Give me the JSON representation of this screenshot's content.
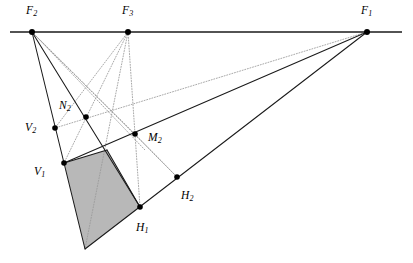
{
  "figure": {
    "canvas": {
      "width": 413,
      "height": 263,
      "background": "#ffffff"
    },
    "colors": {
      "stroke_solid": "#1a1a1a",
      "stroke_dotted": "#9a9a9a",
      "horizon": "#1a1a1a",
      "shaded_fill": "#b8b8b8",
      "point_fill": "#000000",
      "label_color": "#000000"
    },
    "horizon_line": {
      "name": "horizon-line",
      "x1": 10,
      "y1": 32,
      "x2": 402,
      "y2": 32,
      "style": "solid",
      "width": 1.6
    },
    "points": [
      {
        "id": "F2",
        "label": "F",
        "sub": "2",
        "x": 32,
        "y": 32,
        "label_x": 26,
        "label_y": 5,
        "radius": 3.0
      },
      {
        "id": "F3",
        "label": "F",
        "sub": "3",
        "x": 128,
        "y": 32,
        "label_x": 122,
        "label_y": 5,
        "radius": 3.0
      },
      {
        "id": "F1",
        "label": "F",
        "sub": "1",
        "x": 367,
        "y": 32,
        "label_x": 361,
        "label_y": 5,
        "radius": 3.0
      },
      {
        "id": "N2",
        "label": "N",
        "sub": "2",
        "x": 86,
        "y": 117,
        "label_x": 59,
        "label_y": 100,
        "radius": 2.8
      },
      {
        "id": "V2",
        "label": "V",
        "sub": "2",
        "x": 55,
        "y": 128,
        "label_x": 25,
        "label_y": 122,
        "radius": 2.8
      },
      {
        "id": "M2",
        "label": "M",
        "sub": "2",
        "x": 135,
        "y": 134,
        "label_x": 148,
        "label_y": 132,
        "radius": 2.8
      },
      {
        "id": "V1",
        "label": "V",
        "sub": "1",
        "x": 64,
        "y": 163,
        "label_x": 34,
        "label_y": 166,
        "radius": 2.8
      },
      {
        "id": "H2",
        "label": "H",
        "sub": "2",
        "x": 177,
        "y": 177,
        "label_x": 181,
        "label_y": 190,
        "radius": 2.8
      },
      {
        "id": "H1",
        "label": "H",
        "sub": "1",
        "x": 140,
        "y": 207,
        "label_x": 136,
        "label_y": 222,
        "radius": 2.8
      }
    ],
    "shaded_polygon": {
      "name": "shaded-quadrilateral",
      "vertices": "64,163 107,150 140,207 85,249",
      "fill": "#b8b8b8",
      "opacity": 1
    },
    "solid_lines": [
      {
        "name": "line-F2-to-bottom-apex",
        "x1": 32,
        "y1": 32,
        "x2": 85,
        "y2": 249
      },
      {
        "name": "line-F2-through-N2-to-H1",
        "x1": 32,
        "y1": 32,
        "x2": 140,
        "y2": 207
      },
      {
        "name": "line-F1-through-M2-to-V1",
        "x1": 367,
        "y1": 32,
        "x2": 64,
        "y2": 163
      },
      {
        "name": "line-F1-through-H2-to-H1-apex",
        "x1": 367,
        "y1": 32,
        "x2": 85,
        "y2": 249
      },
      {
        "name": "edge-V1-to-corner",
        "x1": 64,
        "y1": 163,
        "x2": 107,
        "y2": 150
      },
      {
        "name": "edge-corner-to-H1",
        "x1": 107,
        "y1": 150,
        "x2": 140,
        "y2": 207
      }
    ],
    "dotted_lines": [
      {
        "name": "dotted-F2-to-M2",
        "x1": 32,
        "y1": 32,
        "x2": 135,
        "y2": 134
      },
      {
        "name": "dotted-F2-to-H2",
        "x1": 32,
        "y1": 32,
        "x2": 177,
        "y2": 177
      },
      {
        "name": "dotted-F2-to-H1-lower",
        "x1": 32,
        "y1": 32,
        "x2": 145,
        "y2": 150
      },
      {
        "name": "dotted-F3-to-V1",
        "x1": 128,
        "y1": 32,
        "x2": 64,
        "y2": 163
      },
      {
        "name": "dotted-F3-to-bottom-apex",
        "x1": 128,
        "y1": 32,
        "x2": 85,
        "y2": 249
      },
      {
        "name": "dotted-F3-to-V2",
        "x1": 128,
        "y1": 32,
        "x2": 55,
        "y2": 128
      },
      {
        "name": "dotted-F3-to-H1",
        "x1": 128,
        "y1": 32,
        "x2": 140,
        "y2": 207
      },
      {
        "name": "dotted-F1-to-V2",
        "x1": 367,
        "y1": 32,
        "x2": 55,
        "y2": 128
      },
      {
        "name": "dotted-M2-to-H2-connector",
        "x1": 135,
        "y1": 134,
        "x2": 177,
        "y2": 177
      }
    ]
  }
}
